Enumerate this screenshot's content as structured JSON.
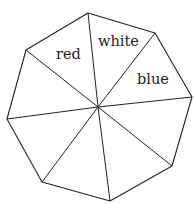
{
  "diagram": {
    "shape": "octagon",
    "sectors": 8,
    "stroke_color": "#222222",
    "background": "#ffffff",
    "center": [
      98,
      107
    ],
    "vertices": [
      [
        88,
        13
      ],
      [
        155,
        33
      ],
      [
        192,
        97
      ],
      [
        172,
        166
      ],
      [
        110,
        201
      ],
      [
        42,
        182
      ],
      [
        7,
        119
      ],
      [
        26,
        50
      ]
    ],
    "labels": [
      {
        "text": "red",
        "x": 56,
        "y": 59
      },
      {
        "text": "white",
        "x": 98,
        "y": 46
      },
      {
        "text": "blue",
        "x": 137,
        "y": 84
      }
    ]
  }
}
